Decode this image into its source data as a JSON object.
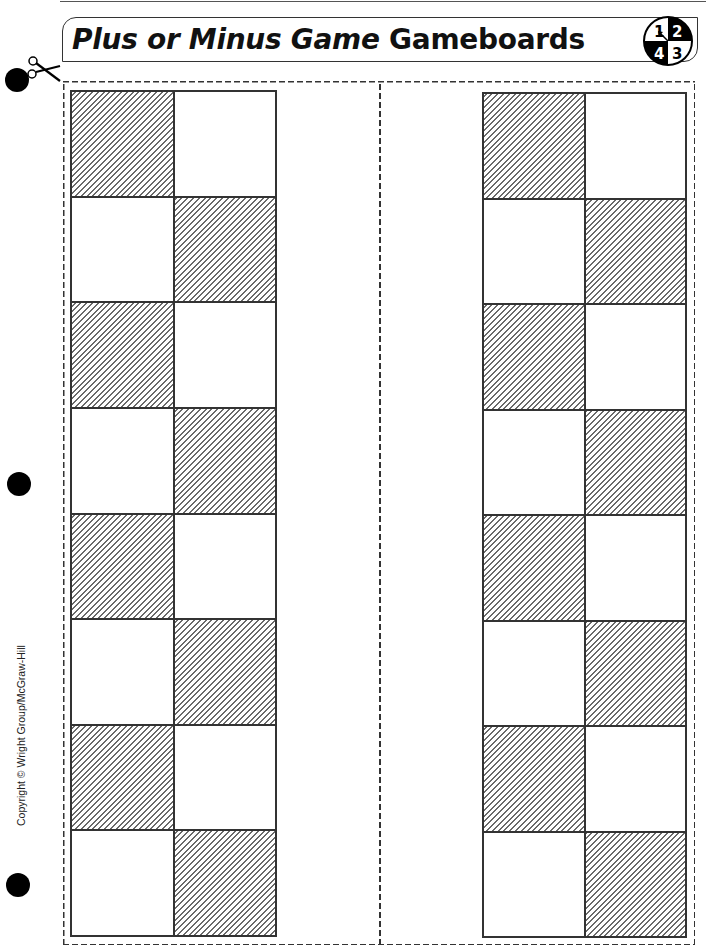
{
  "page": {
    "title_italic": "Plus or Minus Game",
    "title_regular": "Gameboards",
    "spinner": {
      "icon": "spinner-icon",
      "quadrants": [
        {
          "label": "1",
          "fill": "#ffffff",
          "text": "#000000"
        },
        {
          "label": "2",
          "fill": "#000000",
          "text": "#ffffff"
        },
        {
          "label": "3",
          "fill": "#ffffff",
          "text": "#000000"
        },
        {
          "label": "4",
          "fill": "#000000",
          "text": "#ffffff"
        }
      ]
    },
    "copyright": "Copyright © Wright Group/McGraw-Hill",
    "icons": {
      "scissors": "scissors-icon",
      "hole_punch": "hole-punch-icon"
    }
  },
  "boards": [
    {
      "name": "left",
      "rows": 8,
      "cols": 2,
      "hatched_pattern": [
        [
          "hatched",
          "plain"
        ],
        [
          "plain",
          "hatched"
        ],
        [
          "hatched",
          "plain"
        ],
        [
          "plain",
          "hatched"
        ],
        [
          "hatched",
          "plain"
        ],
        [
          "plain",
          "hatched"
        ],
        [
          "hatched",
          "plain"
        ],
        [
          "plain",
          "hatched"
        ]
      ]
    },
    {
      "name": "right",
      "rows": 8,
      "cols": 2,
      "hatched_pattern": [
        [
          "hatched",
          "plain"
        ],
        [
          "plain",
          "hatched"
        ],
        [
          "hatched",
          "plain"
        ],
        [
          "plain",
          "hatched"
        ],
        [
          "hatched",
          "plain"
        ],
        [
          "plain",
          "hatched"
        ],
        [
          "hatched",
          "plain"
        ],
        [
          "plain",
          "hatched"
        ]
      ]
    }
  ],
  "colors": {
    "line": "#333333",
    "hatch": "#6a6a6a",
    "background": "#ffffff"
  }
}
